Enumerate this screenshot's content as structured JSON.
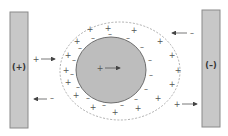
{
  "diagram": {
    "type": "electrophoresis-double-layer",
    "left_electrode": {
      "label": "(+)",
      "polarity": "positive"
    },
    "right_electrode": {
      "label": "(–)",
      "polarity": "negative"
    },
    "particle": {
      "charge_label": "+",
      "motion": "toward negative electrode (right)"
    },
    "counter_ions": {
      "positive_symbol": "+",
      "negative_symbol": "–"
    },
    "ion_flows": [
      {
        "symbol": "+",
        "direction": "right",
        "location": "left-upper"
      },
      {
        "symbol": "–",
        "direction": "left",
        "location": "left-lower"
      },
      {
        "symbol": "–",
        "direction": "left",
        "location": "right-upper"
      },
      {
        "symbol": "+",
        "direction": "right",
        "location": "right-lower"
      }
    ],
    "colors": {
      "plate": "#c8c8c8",
      "particle": "#bdbdbd",
      "outline": "#6e6e6e",
      "background": "#ffffff"
    }
  }
}
